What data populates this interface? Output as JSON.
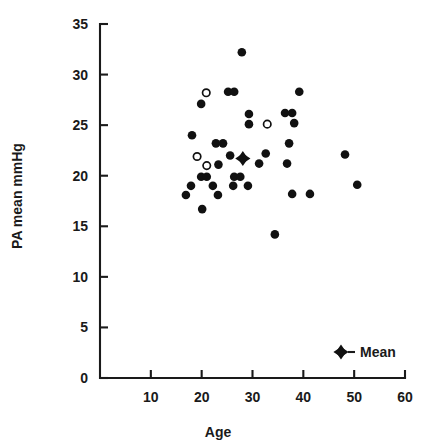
{
  "chart_data": {
    "type": "scatter",
    "title": "",
    "xlabel": "Age",
    "ylabel": "PA mean mmHg",
    "xlim": [
      0,
      60
    ],
    "ylim": [
      0,
      35
    ],
    "xticks": [
      10,
      20,
      30,
      40,
      50,
      60
    ],
    "yticks": [
      0,
      5,
      10,
      15,
      20,
      25,
      30,
      35
    ],
    "xtick_labels": [
      "10",
      "20",
      "30",
      "40",
      "50",
      "60"
    ],
    "ytick_labels": [
      "0",
      "5",
      "10",
      "15",
      "20",
      "25",
      "30",
      "35"
    ],
    "grid": false,
    "legend": {
      "position": "bottom-right",
      "entries": [
        {
          "label": "Mean",
          "marker": "mean-star-marker"
        }
      ]
    },
    "series": [
      {
        "name": "individual-filled",
        "marker": "filled-circle",
        "points": [
          [
            27.9,
            32.2
          ],
          [
            19.9,
            27.1
          ],
          [
            25.2,
            28.3
          ],
          [
            26.4,
            28.3
          ],
          [
            39.2,
            28.3
          ],
          [
            36.4,
            26.2
          ],
          [
            37.8,
            26.2
          ],
          [
            29.3,
            26.1
          ],
          [
            38.2,
            25.2
          ],
          [
            29.3,
            25.1
          ],
          [
            18.1,
            24.0
          ],
          [
            22.8,
            23.2
          ],
          [
            24.2,
            23.2
          ],
          [
            37.2,
            23.2
          ],
          [
            48.2,
            22.1
          ],
          [
            25.6,
            22.0
          ],
          [
            32.6,
            22.2
          ],
          [
            31.3,
            21.2
          ],
          [
            23.3,
            21.1
          ],
          [
            36.8,
            21.2
          ],
          [
            19.9,
            19.9
          ],
          [
            21.0,
            19.9
          ],
          [
            26.4,
            19.9
          ],
          [
            27.6,
            19.9
          ],
          [
            17.9,
            19.0
          ],
          [
            22.2,
            19.0
          ],
          [
            26.2,
            19.0
          ],
          [
            29.1,
            19.0
          ],
          [
            50.6,
            19.1
          ],
          [
            16.9,
            18.1
          ],
          [
            23.2,
            18.1
          ],
          [
            37.8,
            18.2
          ],
          [
            41.3,
            18.2
          ],
          [
            20.1,
            16.7
          ],
          [
            34.4,
            14.2
          ]
        ]
      },
      {
        "name": "individual-open",
        "marker": "open-circle",
        "points": [
          [
            20.9,
            28.2
          ],
          [
            19.1,
            21.9
          ],
          [
            21.0,
            21.0
          ],
          [
            32.9,
            25.1
          ]
        ]
      },
      {
        "name": "mean",
        "marker": "mean-star-marker",
        "points": [
          [
            28.1,
            21.7
          ]
        ]
      }
    ]
  }
}
